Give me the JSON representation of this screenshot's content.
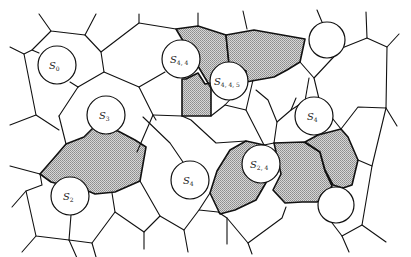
{
  "diagram": {
    "title": "",
    "colors": {
      "line": "#111111",
      "shade": "#b9b9b9",
      "background": "#ffffff",
      "site_fill": "#ffffff"
    },
    "sites": [
      {
        "id": "s0",
        "base": "S",
        "sub": "0"
      },
      {
        "id": "s44",
        "base": "S",
        "sub": "4, 4"
      },
      {
        "id": "s445",
        "base": "S",
        "sub": "4, 4, 5"
      },
      {
        "id": "s3",
        "base": "S",
        "sub": "3"
      },
      {
        "id": "s4r",
        "base": "S",
        "sub": "4"
      },
      {
        "id": "s2",
        "base": "S",
        "sub": "2"
      },
      {
        "id": "s4c",
        "base": "S",
        "sub": "4"
      },
      {
        "id": "s24",
        "base": "S",
        "sub": "2, 4"
      },
      {
        "id": "top-right-unlabeled",
        "base": "",
        "sub": ""
      },
      {
        "id": "bottom-right-unlabeled",
        "base": "",
        "sub": ""
      }
    ],
    "shaded_regions": [
      "region-above-s445",
      "region-between-s44-s445",
      "region-between-s3-s2",
      "region-left-of-s24",
      "region-right-of-s24",
      "region-right-of-s24-b"
    ]
  }
}
